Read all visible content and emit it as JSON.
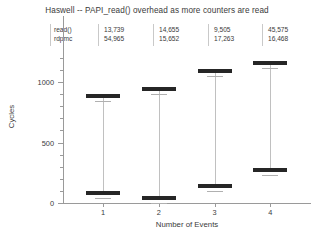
{
  "chart_data": {
    "type": "bar",
    "title": "Haswell -- PAPI_read() overhead as more counters are read",
    "xlabel": "Number of Events",
    "ylabel": "Cycles",
    "categories": [
      "1",
      "2",
      "3",
      "4"
    ],
    "x": [
      1,
      2,
      3,
      4
    ],
    "ylim": [
      0,
      1250
    ],
    "yticks": [
      0,
      500,
      1000
    ],
    "ytick_labels": [
      "0",
      "500",
      "1000"
    ],
    "xticks": [
      1,
      2,
      3,
      4
    ],
    "xtick_labels": [
      "1",
      "2",
      "3",
      "4"
    ],
    "grid": false,
    "legend": "none",
    "series": [
      {
        "name": "read()",
        "values": [
          885,
          940,
          1090,
          1155
        ],
        "sample_counts": [
          "13,739",
          "14,655",
          "9,505",
          "45,575"
        ]
      },
      {
        "name": "rdpmc",
        "values": [
          83,
          40,
          140,
          273
        ],
        "sample_counts": [
          "54,965",
          "15,652",
          "17,263",
          "16,468"
        ]
      }
    ],
    "annotation_table": {
      "rows": [
        {
          "label": "read()",
          "cells": [
            "13,739",
            "14,655",
            "9,505",
            "45,575"
          ]
        },
        {
          "label": "rdpmc",
          "cells": [
            "54,965",
            "15,652",
            "17,263",
            "16,468"
          ]
        }
      ]
    },
    "colors": {
      "marker": "#262626",
      "axis": "#9a9a9a",
      "stem": "#c0c0c0",
      "text": "#3a3a3a",
      "background": "#ffffff"
    }
  }
}
